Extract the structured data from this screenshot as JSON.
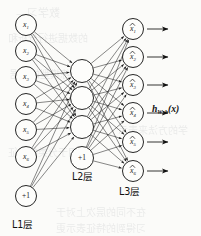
{
  "figure": {
    "type": "neural-network-diagram",
    "background_color": "#fbfbf9",
    "ink_color": "#1a1a1a"
  },
  "output_function_label": {
    "base": "h",
    "subscript": "W, b",
    "argument": "(x)",
    "full": "h_{W, b}(x)"
  },
  "layers": [
    {
      "id": "L1",
      "label": "L1层",
      "label_x": 12,
      "label_y": 228,
      "cx": 26,
      "node_radius": 10.5,
      "nodes": [
        {
          "id": "x1",
          "base": "x",
          "sub": "1",
          "cy": 25,
          "kind": "input"
        },
        {
          "id": "x2",
          "base": "x",
          "sub": "2",
          "cy": 51,
          "kind": "input"
        },
        {
          "id": "x3",
          "base": "x",
          "sub": "3",
          "cy": 77,
          "kind": "input"
        },
        {
          "id": "x4",
          "base": "x",
          "sub": "4",
          "cy": 104,
          "kind": "input"
        },
        {
          "id": "x5",
          "base": "x",
          "sub": "5",
          "cy": 130,
          "kind": "input"
        },
        {
          "id": "x6",
          "base": "x",
          "sub": "6",
          "cy": 157,
          "kind": "input"
        },
        {
          "id": "b1",
          "base": "+1",
          "sub": "",
          "cy": 196,
          "kind": "bias"
        }
      ]
    },
    {
      "id": "L2",
      "label": "L2层",
      "label_x": 72,
      "label_y": 180,
      "cx": 82,
      "node_radius": 11.5,
      "nodes": [
        {
          "id": "h1",
          "base": "",
          "sub": "",
          "cy": 71,
          "kind": "hidden"
        },
        {
          "id": "h2",
          "base": "",
          "sub": "",
          "cy": 98,
          "kind": "hidden"
        },
        {
          "id": "h3",
          "base": "",
          "sub": "",
          "cy": 127,
          "kind": "hidden"
        },
        {
          "id": "b2",
          "base": "+1",
          "sub": "",
          "cy": 158,
          "kind": "bias"
        }
      ]
    },
    {
      "id": "L3",
      "label": "L3层",
      "label_x": 119,
      "label_y": 195,
      "cx": 133,
      "node_radius": 10.5,
      "nodes": [
        {
          "id": "y1",
          "base": "x",
          "sub": "1",
          "cy": 29,
          "kind": "output",
          "hat": true
        },
        {
          "id": "y2",
          "base": "x",
          "sub": "2",
          "cy": 57,
          "kind": "output",
          "hat": true
        },
        {
          "id": "y3",
          "base": "x",
          "sub": "3",
          "cy": 85,
          "kind": "output",
          "hat": true
        },
        {
          "id": "y4",
          "base": "x",
          "sub": "4",
          "cy": 113,
          "kind": "output",
          "hat": true
        },
        {
          "id": "y5",
          "base": "x",
          "sub": "5",
          "cy": 142,
          "kind": "output",
          "hat": true
        },
        {
          "id": "y6",
          "base": "x",
          "sub": "6",
          "cy": 171,
          "kind": "output",
          "hat": true
        }
      ]
    }
  ],
  "output_arrows": [
    {
      "id": "a1",
      "y": 29
    },
    {
      "id": "a2",
      "y": 57
    },
    {
      "id": "a3",
      "y": 85
    },
    {
      "id": "a4",
      "y": 113
    },
    {
      "id": "a5",
      "y": 142
    },
    {
      "id": "a6",
      "y": 171
    }
  ],
  "h_label_position": {
    "x": 152,
    "y": 112
  },
  "ghost_text": [
    {
      "text": "数学习—",
      "x": 16,
      "y": 4,
      "size": 11
    },
    {
      "text": "的数据进行分析和",
      "x": 8,
      "y": 30,
      "size": 10
    },
    {
      "text": "训练模型的数据",
      "x": 10,
      "y": 66,
      "size": 10
    },
    {
      "text": "学的方法来表示",
      "x": 118,
      "y": 122,
      "size": 10
    },
    {
      "text": "用于分类的特征",
      "x": 8,
      "y": 144,
      "size": 10
    },
    {
      "text": "在不同的层次上对于",
      "x": 56,
      "y": 204,
      "size": 10
    },
    {
      "text": "习得到的特征表示更",
      "x": 56,
      "y": 220,
      "size": 10
    }
  ]
}
